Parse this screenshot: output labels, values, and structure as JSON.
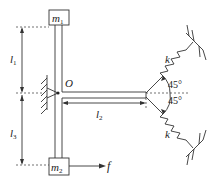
{
  "diagram": {
    "masses": {
      "top": {
        "symbol": "m",
        "sub": "1"
      },
      "bottom": {
        "symbol": "m",
        "sub": "2"
      }
    },
    "pivot_label": "O",
    "lengths": {
      "l1": {
        "symbol": "l",
        "sub": "1"
      },
      "l2": {
        "symbol": "l",
        "sub": "2"
      },
      "l3": {
        "symbol": "l",
        "sub": "3"
      }
    },
    "force_label": "f",
    "springs": {
      "upper": {
        "label": "k",
        "angle": "45°"
      },
      "lower": {
        "label": "k",
        "angle": "45°"
      }
    },
    "colors": {
      "line": "#333333",
      "background": "#ffffff"
    }
  }
}
